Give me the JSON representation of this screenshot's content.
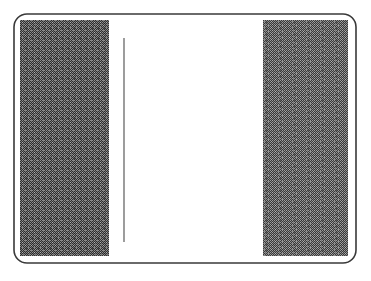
{
  "figure": {
    "title": "",
    "caption": "",
    "background_color": "#ffffff",
    "canvas": {
      "width": 371,
      "height": 281
    },
    "frame": {
      "name": "rounded-rectangle-border",
      "x": 14,
      "y": 14,
      "width": 342,
      "height": 249,
      "corner_radius": 13,
      "stroke_color": "#3a3a3a",
      "stroke_width": 1.6,
      "fill": "none"
    },
    "blocks": [
      {
        "id": "left-shaded-block",
        "label": "",
        "x": 20,
        "y": 20,
        "width": 89,
        "height": 236,
        "fill_color": "#4a4a4a",
        "pattern": "dither-checker",
        "mean_gray": "#555555"
      },
      {
        "id": "right-shaded-block",
        "label": "",
        "x": 263,
        "y": 20,
        "width": 85,
        "height": 236,
        "fill_color": "#575757",
        "pattern": "dither-checker",
        "mean_gray": "#606060"
      }
    ],
    "divider_line": {
      "id": "vertical-rule",
      "label": "",
      "x": 124,
      "y_start": 38,
      "y_end": 242,
      "stroke_color": "#4b4b4b",
      "stroke_width": 1.1
    },
    "gap": {
      "id": "white-gap",
      "x": 109,
      "width": 154,
      "fill_color": "#ffffff"
    }
  }
}
